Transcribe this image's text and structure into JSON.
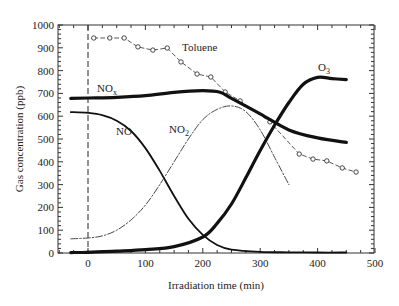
{
  "chart_data": {
    "type": "line",
    "title": "",
    "xlabel": "Irradiation time (min)",
    "ylabel": "Gas concentration (ppb)",
    "xlim": [
      -50,
      500
    ],
    "ylim": [
      0,
      1000
    ],
    "xticks": [
      0,
      100,
      200,
      300,
      400,
      500
    ],
    "yticks": [
      0,
      100,
      200,
      300,
      400,
      500,
      600,
      700,
      800,
      900,
      1000
    ],
    "grid": false,
    "legend": "inline labels",
    "annotations": [
      {
        "type": "vertical-dashed-line",
        "x": 0
      }
    ],
    "series": [
      {
        "name": "Toluene",
        "style": "dashed with open circles",
        "x": [
          10,
          38,
          63,
          87,
          113,
          138,
          162,
          190,
          214,
          239,
          265,
          317,
          368,
          392,
          416,
          443,
          467
        ],
        "values": [
          943,
          943,
          943,
          904,
          890,
          899,
          838,
          785,
          772,
          706,
          667,
          575,
          434,
          412,
          404,
          373,
          355
        ]
      },
      {
        "name": "NOx",
        "style": "thick solid",
        "x": [
          -30,
          0,
          50,
          100,
          150,
          200,
          230,
          250,
          300,
          350,
          400,
          450
        ],
        "values": [
          678,
          680,
          683,
          690,
          705,
          712,
          705,
          678,
          610,
          540,
          505,
          485
        ]
      },
      {
        "name": "NO",
        "style": "solid",
        "x": [
          -30,
          0,
          25,
          50,
          75,
          100,
          125,
          150,
          175,
          200,
          225,
          250,
          300,
          350,
          400,
          450
        ],
        "values": [
          618,
          615,
          605,
          580,
          535,
          460,
          360,
          250,
          150,
          80,
          35,
          15,
          5,
          3,
          2,
          2
        ]
      },
      {
        "name": "NO2",
        "style": "dash-dot",
        "x": [
          -30,
          0,
          25,
          50,
          75,
          100,
          125,
          150,
          175,
          200,
          225,
          250,
          275,
          300,
          325,
          350
        ],
        "values": [
          62,
          66,
          75,
          100,
          145,
          210,
          300,
          400,
          500,
          585,
          630,
          645,
          620,
          540,
          420,
          300
        ]
      },
      {
        "name": "O3",
        "style": "thick solid",
        "x": [
          -30,
          0,
          50,
          100,
          150,
          200,
          225,
          250,
          275,
          300,
          325,
          350,
          375,
          400,
          425,
          450
        ],
        "values": [
          2,
          3,
          8,
          15,
          28,
          70,
          130,
          215,
          330,
          450,
          560,
          660,
          740,
          770,
          765,
          760
        ]
      }
    ]
  },
  "labels": {
    "xlabel": "Irradiation time (min)",
    "ylabel": "Gas concentration (ppb)",
    "toluene": "Toluene",
    "nox_main": "NO",
    "nox_sub": "x",
    "no": "NO",
    "no2_main": "NO",
    "no2_sub": "2",
    "o3_main": "O",
    "o3_sub": "3"
  }
}
